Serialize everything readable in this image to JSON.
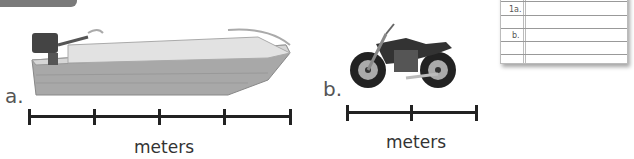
{
  "header_tab": {
    "color": "#7a7a7a"
  },
  "items": [
    {
      "label": "a.",
      "image": "boat",
      "unit": "meters",
      "ruler_segments": 4
    },
    {
      "label": "b.",
      "image": "motorcycle",
      "unit": "meters",
      "ruler_segments": 2
    }
  ],
  "answer_pad": {
    "lines": [
      {
        "label": "1a."
      },
      {
        "label": ""
      },
      {
        "label": "b."
      },
      {
        "label": ""
      }
    ]
  }
}
